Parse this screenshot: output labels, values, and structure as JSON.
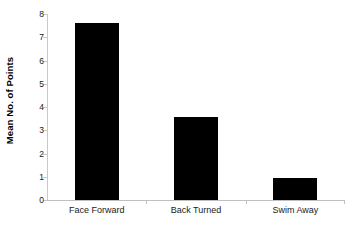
{
  "chart_data": {
    "type": "bar",
    "title": "",
    "subtitle": "",
    "xlabel": "",
    "ylabel": "Mean No. of Points",
    "categories": [
      "Face Forward",
      "Back Turned",
      "Swim Away"
    ],
    "values": [
      7.6,
      3.55,
      0.95
    ],
    "ylim": [
      0,
      8
    ],
    "yticks": [
      0,
      1,
      2,
      3,
      4,
      5,
      6,
      7,
      8
    ],
    "ytick_labels": [
      "0",
      "1",
      "2",
      "3",
      "4",
      "5",
      "6",
      "7",
      "8"
    ],
    "grid": false,
    "legend": null,
    "legend_position": "none",
    "bar_color": "#000000",
    "axis_color": "#c0c0c0",
    "text_color": "#1a1a1a",
    "background": "#ffffff"
  }
}
